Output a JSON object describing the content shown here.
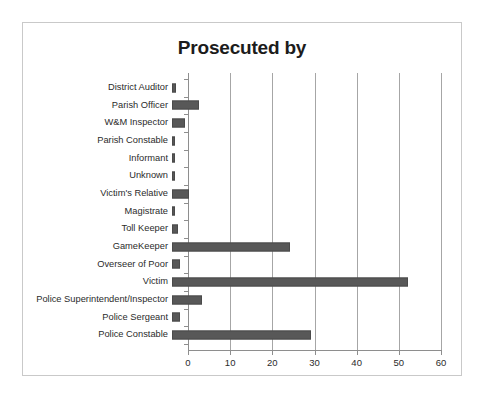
{
  "chart_data": {
    "type": "bar",
    "orientation": "horizontal",
    "title": "Prosecuted by",
    "xlabel": "",
    "ylabel": "",
    "xlim": [
      0,
      60
    ],
    "xticks": [
      "0",
      "10",
      "20",
      "30",
      "40",
      "50",
      "60"
    ],
    "xtick_values": [
      0,
      10,
      20,
      30,
      40,
      50,
      60
    ],
    "grid": "vertical",
    "legend": "none",
    "bar_color": "#585858",
    "gridline_color": "#a6a6a6",
    "axis_color": "#8e8e8e",
    "categories": [
      "District Auditor",
      "Parish Officer",
      "W&M Inspector",
      "Parish Constable",
      "Informant",
      "Unknown",
      "Victim's Relative",
      "Magistrate",
      "Toll Keeper",
      "GameKeeper",
      "Overseer of Poor",
      "Victim",
      "Police Superintendent/Inspector",
      "Police Sergeant",
      "Police Constable"
    ],
    "values": [
      1,
      6.5,
      3,
      0.5,
      0.5,
      0.5,
      4,
      0.5,
      1.5,
      28,
      2,
      56,
      7,
      2,
      33
    ]
  },
  "figure": {
    "border_color": "#c9c9c9",
    "background": "#ffffff"
  }
}
